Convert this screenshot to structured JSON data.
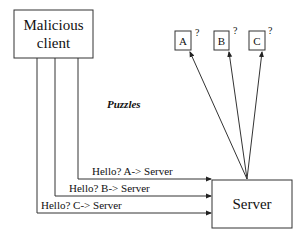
{
  "diagram": {
    "client": {
      "label_line1": "Malicious",
      "label_line2": "client"
    },
    "server": {
      "label": "Server"
    },
    "puzzles_label": "Puzzles",
    "puzzle_boxes": [
      {
        "label": "A",
        "mark": "?"
      },
      {
        "label": "B",
        "mark": "?"
      },
      {
        "label": "C",
        "mark": "?"
      }
    ],
    "messages": [
      {
        "label": "Hello?  A-> Server"
      },
      {
        "label": "Hello?  B-> Server"
      },
      {
        "label": "Hello?  C-> Server"
      }
    ],
    "colors": {
      "stroke": "#333333",
      "text": "#111111",
      "background": "#ffffff"
    }
  }
}
